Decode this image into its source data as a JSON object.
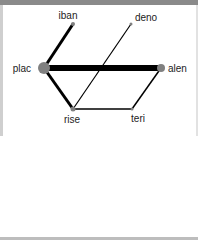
{
  "graph": {
    "nodes": [
      {
        "id": "iban",
        "label": "iban",
        "x": 73,
        "y": 24,
        "r": 2,
        "lx": 68,
        "ly": 19,
        "anchor": "middle"
      },
      {
        "id": "deno",
        "label": "deno",
        "x": 131,
        "y": 24,
        "r": 1.5,
        "lx": 146,
        "ly": 21,
        "anchor": "middle"
      },
      {
        "id": "plac",
        "label": "plac",
        "x": 44,
        "y": 68,
        "r": 6,
        "lx": 31,
        "ly": 72,
        "anchor": "end"
      },
      {
        "id": "alen",
        "label": "alen",
        "x": 161,
        "y": 68,
        "r": 4,
        "lx": 168,
        "ly": 72,
        "anchor": "start"
      },
      {
        "id": "rise",
        "label": "rise",
        "x": 73,
        "y": 109,
        "r": 2.5,
        "lx": 72,
        "ly": 123,
        "anchor": "middle"
      },
      {
        "id": "teri",
        "label": "teri",
        "x": 132,
        "y": 109,
        "r": 1.5,
        "lx": 138,
        "ly": 122,
        "anchor": "middle"
      }
    ],
    "edges": [
      {
        "source": "plac",
        "target": "alen",
        "width": 6
      },
      {
        "source": "plac",
        "target": "iban",
        "width": 3
      },
      {
        "source": "plac",
        "target": "rise",
        "width": 3
      },
      {
        "source": "rise",
        "target": "deno",
        "width": 1.2
      },
      {
        "source": "rise",
        "target": "teri",
        "width": 1.5
      },
      {
        "source": "teri",
        "target": "alen",
        "width": 1.5
      }
    ],
    "node_color": "#808080",
    "edge_color": "#000000"
  }
}
